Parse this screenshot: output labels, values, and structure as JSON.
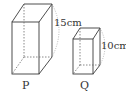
{
  "figure": {
    "prisms": [
      {
        "name": "P",
        "height_label": "15cm",
        "height_value": "15",
        "height_unit": "cm"
      },
      {
        "name": "Q",
        "height_label": "10cm",
        "height_value": "10",
        "height_unit": "cm"
      }
    ],
    "colors": {
      "edge": "#3a3a3a",
      "hidden_edge": "#6a6a6a",
      "dimension_arc": "#9a9a9a",
      "background": "#ffffff"
    }
  }
}
